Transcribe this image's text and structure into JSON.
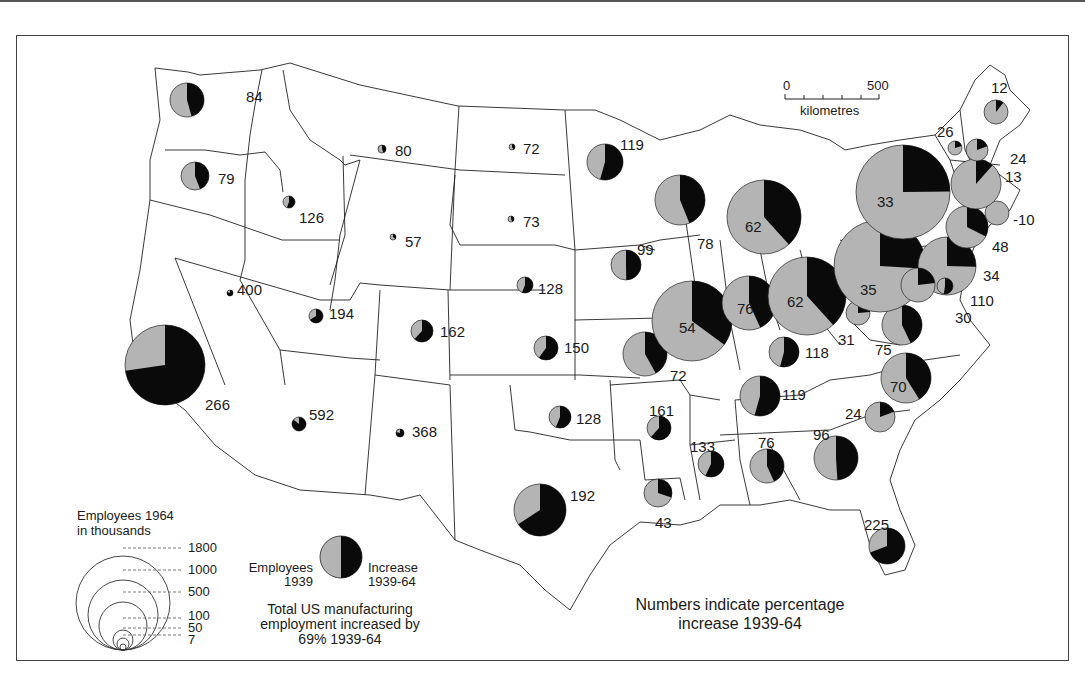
{
  "scale_bar": {
    "start": "0",
    "end": "500",
    "unit": "kilometres"
  },
  "legend": {
    "size_title_line1": "Employees 1964",
    "size_title_line2": "in thousands",
    "size_values": [
      "1800",
      "1000",
      "500",
      "100",
      "50",
      "7"
    ],
    "pie_left_line1": "Employees",
    "pie_left_line2": "1939",
    "pie_right_line1": "Increase",
    "pie_right_line2": "1939-64",
    "total_line1": "Total US manufacturing",
    "total_line2": "employment increased by",
    "total_line3": "69% 1939-64"
  },
  "note": {
    "line1": "Numbers indicate percentage",
    "line2": "increase 1939-64"
  },
  "colors": {
    "employees_1939": "#b4b4b4",
    "increase": "#0a0a0a",
    "border": "#222222"
  },
  "chart_data": {
    "type": "proportional-pie-map",
    "size_variable": "Employees 1964 (thousands)",
    "pie_segments": [
      "Employees 1939",
      "Increase 1939-64"
    ],
    "value_label": "Percentage increase 1939-64",
    "us_total_increase_pct": 69,
    "states": [
      {
        "state": "Washington",
        "pct": 84,
        "x": 187,
        "y": 100,
        "r": 17,
        "lx": 246,
        "ly": 97
      },
      {
        "state": "Oregon",
        "pct": 79,
        "x": 195,
        "y": 176,
        "r": 14,
        "lx": 218,
        "ly": 179
      },
      {
        "state": "California",
        "pct": 266,
        "x": 165,
        "y": 365,
        "r": 40,
        "lx": 205,
        "ly": 405
      },
      {
        "state": "Idaho",
        "pct": 126,
        "x": 289,
        "y": 202,
        "r": 6,
        "lx": 299,
        "ly": 218
      },
      {
        "state": "Nevada",
        "pct": 400,
        "x": 230,
        "y": 293,
        "r": 3,
        "lx": 237,
        "ly": 290
      },
      {
        "state": "Montana",
        "pct": 80,
        "x": 382,
        "y": 149,
        "r": 4,
        "lx": 395,
        "ly": 151
      },
      {
        "state": "Wyoming",
        "pct": 57,
        "x": 393,
        "y": 237,
        "r": 3,
        "lx": 405,
        "ly": 242
      },
      {
        "state": "Utah",
        "pct": 194,
        "x": 316,
        "y": 316,
        "r": 7,
        "lx": 329,
        "ly": 314
      },
      {
        "state": "Colorado",
        "pct": 162,
        "x": 422,
        "y": 331,
        "r": 11,
        "lx": 440,
        "ly": 332
      },
      {
        "state": "Arizona",
        "pct": 592,
        "x": 299,
        "y": 424,
        "r": 7,
        "lx": 309,
        "ly": 415
      },
      {
        "state": "New Mexico",
        "pct": 368,
        "x": 400,
        "y": 433,
        "r": 4,
        "lx": 412,
        "ly": 432
      },
      {
        "state": "North Dakota",
        "pct": 72,
        "x": 512,
        "y": 147,
        "r": 3,
        "lx": 523,
        "ly": 149
      },
      {
        "state": "South Dakota",
        "pct": 73,
        "x": 511,
        "y": 219,
        "r": 3,
        "lx": 523,
        "ly": 222
      },
      {
        "state": "Nebraska",
        "pct": 128,
        "x": 525,
        "y": 285,
        "r": 8,
        "lx": 538,
        "ly": 289
      },
      {
        "state": "Kansas",
        "pct": 150,
        "x": 546,
        "y": 348,
        "r": 12,
        "lx": 564,
        "ly": 348
      },
      {
        "state": "Oklahoma",
        "pct": 128,
        "x": 560,
        "y": 417,
        "r": 11,
        "lx": 576,
        "ly": 419
      },
      {
        "state": "Texas",
        "pct": 192,
        "x": 540,
        "y": 510,
        "r": 26,
        "lx": 570,
        "ly": 496
      },
      {
        "state": "Minnesota",
        "pct": 119,
        "x": 605,
        "y": 162,
        "r": 18,
        "lx": 620,
        "ly": 145
      },
      {
        "state": "Iowa",
        "pct": 99,
        "x": 626,
        "y": 265,
        "r": 15,
        "lx": 637,
        "ly": 250
      },
      {
        "state": "Missouri",
        "pct": 72,
        "x": 645,
        "y": 354,
        "r": 22,
        "lx": 670,
        "ly": 376
      },
      {
        "state": "Arkansas",
        "pct": 161,
        "x": 659,
        "y": 428,
        "r": 12,
        "lx": 649,
        "ly": 411
      },
      {
        "state": "Louisiana",
        "pct": 43,
        "x": 658,
        "y": 493,
        "r": 14,
        "lx": 655,
        "ly": 523
      },
      {
        "state": "Wisconsin",
        "pct": 78,
        "x": 680,
        "y": 200,
        "r": 25,
        "lx": 697,
        "ly": 244
      },
      {
        "state": "Illinois",
        "pct": 54,
        "x": 692,
        "y": 321,
        "r": 40,
        "lx": 679,
        "ly": 328
      },
      {
        "state": "Michigan",
        "pct": 62,
        "x": 764,
        "y": 217,
        "r": 37,
        "lx": 745,
        "ly": 227
      },
      {
        "state": "Indiana",
        "pct": 76,
        "x": 749,
        "y": 303,
        "r": 27,
        "lx": 737,
        "ly": 309
      },
      {
        "state": "Ohio",
        "pct": 62,
        "x": 807,
        "y": 296,
        "r": 39,
        "lx": 787,
        "ly": 302
      },
      {
        "state": "Kentucky",
        "pct": 118,
        "x": 784,
        "y": 352,
        "r": 15,
        "lx": 805,
        "ly": 353
      },
      {
        "state": "Tennessee",
        "pct": 119,
        "x": 760,
        "y": 396,
        "r": 20,
        "lx": 782,
        "ly": 395
      },
      {
        "state": "Mississippi",
        "pct": 133,
        "x": 711,
        "y": 464,
        "r": 13,
        "lx": 690,
        "ly": 447
      },
      {
        "state": "Alabama",
        "pct": 76,
        "x": 767,
        "y": 466,
        "r": 17,
        "lx": 758,
        "ly": 443
      },
      {
        "state": "Georgia",
        "pct": 96,
        "x": 836,
        "y": 458,
        "r": 22,
        "lx": 813,
        "ly": 435
      },
      {
        "state": "Florida",
        "pct": 225,
        "x": 887,
        "y": 546,
        "r": 18,
        "lx": 864,
        "ly": 525
      },
      {
        "state": "South Carolina",
        "pct": 24,
        "x": 880,
        "y": 417,
        "r": 15,
        "lx": 845,
        "ly": 414
      },
      {
        "state": "North Carolina",
        "pct": 70,
        "x": 906,
        "y": 378,
        "r": 25,
        "lx": 890,
        "ly": 387
      },
      {
        "state": "Virginia",
        "pct": 75,
        "x": 902,
        "y": 325,
        "r": 20,
        "lx": 875,
        "ly": 350
      },
      {
        "state": "West Virginia",
        "pct": 31,
        "x": 858,
        "y": 313,
        "r": 12,
        "lx": 838,
        "ly": 340
      },
      {
        "state": "Pennsylvania",
        "pct": 35,
        "x": 880,
        "y": 266,
        "r": 46,
        "lx": 860,
        "ly": 290
      },
      {
        "state": "New York",
        "pct": 33,
        "x": 903,
        "y": 192,
        "r": 47,
        "lx": 877,
        "ly": 202
      },
      {
        "state": "New Jersey",
        "pct": 34,
        "x": 947,
        "y": 266,
        "r": 29,
        "lx": 983,
        "ly": 276
      },
      {
        "state": "Maryland",
        "pct": 30,
        "x": 918,
        "y": 285,
        "r": 17,
        "lx": 955,
        "ly": 318
      },
      {
        "state": "Delaware",
        "pct": 110,
        "x": 945,
        "y": 286,
        "r": 8,
        "lx": 970,
        "ly": 301
      },
      {
        "state": "Connecticut",
        "pct": 48,
        "x": 967,
        "y": 227,
        "r": 21,
        "lx": 992,
        "ly": 247
      },
      {
        "state": "Rhode Island",
        "pct": -10,
        "x": 997,
        "y": 213,
        "r": 12,
        "lx": 1013,
        "ly": 220
      },
      {
        "state": "Massachusetts",
        "pct": 13,
        "x": 976,
        "y": 184,
        "r": 25,
        "lx": 1005,
        "ly": 177
      },
      {
        "state": "Vermont",
        "pct": 26,
        "x": 955,
        "y": 148,
        "r": 7,
        "lx": 937,
        "ly": 132
      },
      {
        "state": "New Hampshire",
        "pct": 24,
        "x": 977,
        "y": 150,
        "r": 11,
        "lx": 1010,
        "ly": 159
      },
      {
        "state": "Maine",
        "pct": 12,
        "x": 996,
        "y": 112,
        "r": 12,
        "lx": 991,
        "ly": 88
      }
    ]
  }
}
